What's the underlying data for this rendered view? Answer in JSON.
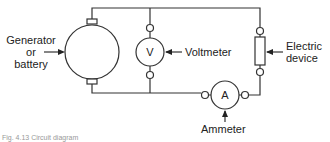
{
  "diagram": {
    "type": "circuit",
    "components": {
      "generator": {
        "label_line1": "Generator",
        "label_line2": "or",
        "label_line3": "battery"
      },
      "voltmeter": {
        "symbol": "V",
        "label": "Voltmeter"
      },
      "ammeter": {
        "symbol": "A",
        "label": "Ammeter"
      },
      "device": {
        "label_line1": "Electric",
        "label_line2": "device"
      }
    },
    "caption": "Fig. 4.13 Circuit diagram",
    "colors": {
      "line": "#333333",
      "background": "#ffffff"
    }
  }
}
